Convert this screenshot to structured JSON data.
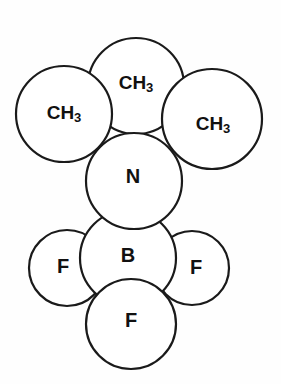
{
  "figure": {
    "background_color": "#fefefe",
    "outline_color": "#1a1a1a",
    "fill_color": "#ffffff"
  },
  "atoms": [
    {
      "id": "ch3-top",
      "label": "CH3",
      "base": "CH",
      "sub": "3",
      "cx": 136,
      "cy": 86,
      "r": 48,
      "label_x": 136,
      "label_y": 84,
      "kind": "methyl",
      "layer": 3
    },
    {
      "id": "ch3-left",
      "label": "CH3",
      "base": "CH",
      "sub": "3",
      "cx": 64,
      "cy": 114,
      "r": 48,
      "label_x": 64,
      "label_y": 114,
      "kind": "methyl",
      "layer": 6
    },
    {
      "id": "ch3-right",
      "label": "CH3",
      "base": "CH",
      "sub": "3",
      "cx": 212,
      "cy": 119,
      "r": 50,
      "label_x": 213,
      "label_y": 125,
      "kind": "methyl",
      "layer": 5
    },
    {
      "id": "nitrogen",
      "label": "N",
      "base": "N",
      "sub": "",
      "cx": 134,
      "cy": 181,
      "r": 48,
      "label_x": 133,
      "label_y": 178,
      "kind": "nitrogen",
      "layer": 4
    },
    {
      "id": "boron",
      "label": "B",
      "base": "B",
      "sub": "",
      "cx": 128,
      "cy": 258,
      "r": 48,
      "label_x": 128,
      "label_y": 257,
      "kind": "boron",
      "layer": 2
    },
    {
      "id": "fluorine-left",
      "label": "F",
      "base": "F",
      "sub": "",
      "cx": 67,
      "cy": 268,
      "r": 38,
      "label_x": 63,
      "label_y": 268,
      "kind": "fluorine",
      "layer": 1
    },
    {
      "id": "fluorine-right",
      "label": "F",
      "base": "F",
      "sub": "",
      "cx": 192,
      "cy": 268,
      "r": 37,
      "label_x": 196,
      "label_y": 269,
      "kind": "fluorine",
      "layer": 1
    },
    {
      "id": "fluorine-bottom",
      "label": "F",
      "base": "F",
      "sub": "",
      "cx": 131,
      "cy": 324,
      "r": 45,
      "label_x": 131,
      "label_y": 322,
      "kind": "fluorine",
      "layer": 7
    }
  ]
}
